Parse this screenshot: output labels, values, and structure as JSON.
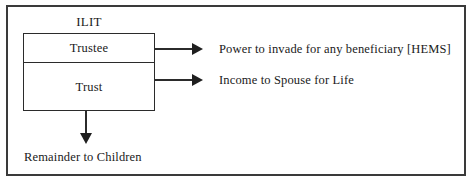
{
  "diagram": {
    "title": "ILIT",
    "entity_box": {
      "cells": [
        {
          "label": "Trustee"
        },
        {
          "label": "Trust"
        }
      ]
    },
    "flows": [
      {
        "from": "Trustee",
        "arrow": "arrow-right-icon",
        "label": "Power to invade for any beneficiary [HEMS]"
      },
      {
        "from": "Trust",
        "arrow": "arrow-right-icon",
        "label": "Income to Spouse for Life"
      },
      {
        "from": "Trust",
        "arrow": "arrow-down-icon",
        "label": "Remainder to Children"
      }
    ],
    "colors": {
      "background": "#ffffff",
      "ink": "#1a1a1a",
      "frame": "#3a3a3a",
      "box_border": "#2b2b2b",
      "arrow": "#1f1f1f"
    }
  }
}
